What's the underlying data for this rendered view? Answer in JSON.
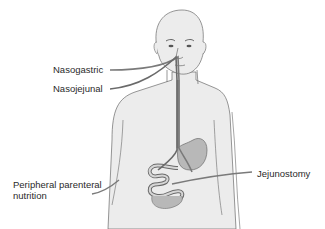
{
  "diagram": {
    "labels": {
      "nasogastric": "Nasogastric",
      "nasojejunal": "Nasojejunal",
      "jejunostomy": "Jejunostomy",
      "peripheral_parenteral": "Peripheral parenteral nutrition"
    },
    "colors": {
      "body_fill": "#ececec",
      "body_outline": "#6a6a6a",
      "stomach_fill": "#b8b8b8",
      "tube": "#7a7a7a",
      "text": "#2a2a2a"
    }
  }
}
